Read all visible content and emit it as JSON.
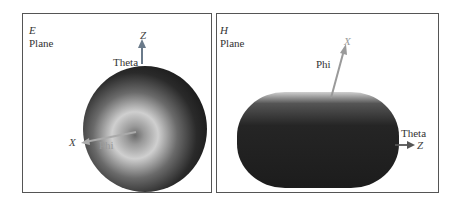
{
  "panels": [
    {
      "id": "E",
      "title_letter": "E",
      "title_word": "Plane",
      "axes": {
        "vertical": "Z",
        "horizontal": "X"
      },
      "angle_labels": {
        "theta": "Theta",
        "phi": "Phi"
      }
    },
    {
      "id": "H",
      "title_letter": "H",
      "title_word": "Plane",
      "axes": {
        "vertical": "X",
        "horizontal": "Z"
      },
      "angle_labels": {
        "theta": "Theta",
        "phi": "Phi"
      }
    }
  ],
  "colors": {
    "frame": "#555555",
    "pattern_dark": "#1e1e1e",
    "pattern_light": "#d8d8d8",
    "axis_arrow": "#7a7a7a"
  }
}
